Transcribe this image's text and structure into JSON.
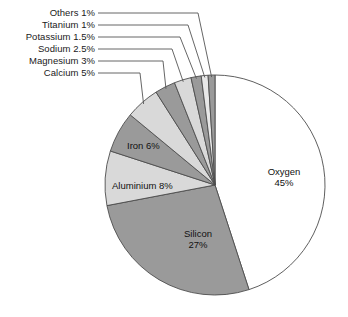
{
  "chart_data": {
    "type": "pie",
    "title": "",
    "subtitle": "",
    "xlabel": "",
    "ylabel": "",
    "legend_position": "none",
    "grid": false,
    "units": "percent",
    "start_angle_deg": 0,
    "direction": "clockwise",
    "categories": [
      "Oxygen",
      "Silicon",
      "Aluminium",
      "Iron",
      "Calcium",
      "Magnesium",
      "Sodium",
      "Potassium",
      "Titanium",
      "Others"
    ],
    "values": [
      45,
      27,
      8,
      6,
      5,
      3,
      2.5,
      1.5,
      1,
      1
    ],
    "slices": [
      {
        "name": "Oxygen",
        "value": 45,
        "value_text": "45%",
        "label_line1": "Oxygen",
        "label_line2": "45%",
        "color": "#ffffff",
        "label_style": "inside"
      },
      {
        "name": "Silicon",
        "value": 27,
        "value_text": "27%",
        "label_line1": "Silicon",
        "label_line2": "27%",
        "color": "#9a9a9a",
        "label_style": "inside"
      },
      {
        "name": "Aluminium",
        "value": 8,
        "value_text": "8%",
        "label_line1": "Aluminium 8%",
        "label_line2": "",
        "color": "#d9d9d9",
        "label_style": "inside"
      },
      {
        "name": "Iron",
        "value": 6,
        "value_text": "6%",
        "label_line1": "Iron 6%",
        "label_line2": "",
        "color": "#9a9a9a",
        "label_style": "inside"
      },
      {
        "name": "Calcium",
        "value": 5,
        "value_text": "5%",
        "label_line1": "Calcium 5%",
        "label_line2": "",
        "color": "#d9d9d9",
        "label_style": "callout"
      },
      {
        "name": "Magnesium",
        "value": 3,
        "value_text": "3%",
        "label_line1": "Magnesium 3%",
        "label_line2": "",
        "color": "#9a9a9a",
        "label_style": "callout"
      },
      {
        "name": "Sodium",
        "value": 2.5,
        "value_text": "2.5%",
        "label_line1": "Sodium 2.5%",
        "label_line2": "",
        "color": "#d9d9d9",
        "label_style": "callout"
      },
      {
        "name": "Potassium",
        "value": 1.5,
        "value_text": "1.5%",
        "label_line1": "Potassium 1.5%",
        "label_line2": "",
        "color": "#9a9a9a",
        "label_style": "callout"
      },
      {
        "name": "Titanium",
        "value": 1,
        "value_text": "1%",
        "label_line1": "Titanium 1%",
        "label_line2": "",
        "color": "#e8e8e8",
        "label_style": "callout"
      },
      {
        "name": "Others",
        "value": 1,
        "value_text": "1%",
        "label_line1": "Others 1%",
        "label_line2": "",
        "color": "#9a9a9a",
        "label_style": "callout"
      }
    ]
  },
  "callouts": [
    {
      "text": "Others 1%"
    },
    {
      "text": "Titanium 1%"
    },
    {
      "text": "Potassium 1.5%"
    },
    {
      "text": "Sodium 2.5%"
    },
    {
      "text": "Magnesium 3%"
    },
    {
      "text": "Calcium 5%"
    }
  ],
  "inside_labels": {
    "oxygen": {
      "name": "Oxygen",
      "pct": "45%"
    },
    "silicon": {
      "name": "Silicon",
      "pct": "27%"
    },
    "aluminium": {
      "text": "Aluminium 8%"
    },
    "iron": {
      "text": "Iron 6%"
    }
  },
  "colors": {
    "background": "#ffffff",
    "outline": "#4d4d4d",
    "leader_line": "#555555",
    "text": "#1a1a1a",
    "fill_dark": "#9a9a9a",
    "fill_light": "#d9d9d9",
    "fill_lighter": "#e8e8e8",
    "fill_white": "#ffffff"
  }
}
